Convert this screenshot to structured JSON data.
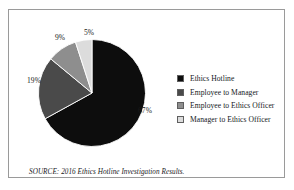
{
  "figure": {
    "background_color": "#ffffff",
    "frame_color": "#9a9a9a"
  },
  "chart_data": {
    "type": "pie",
    "title": "",
    "categories": [
      "Ethics Hotline",
      "Employee to Manager",
      "Employee to Ethics Officer",
      "Manager to Ethics Officer"
    ],
    "values": [
      67,
      19,
      9,
      5
    ],
    "value_labels": [
      "67%",
      "19%",
      "9%",
      "5%"
    ],
    "unit": "percent",
    "colors": [
      "#0d0d0d",
      "#4a4a4a",
      "#8e8e8e",
      "#dcdcdc"
    ],
    "start_angle_deg": 0,
    "direction": "clockwise",
    "labels_position": "outside",
    "legend_position": "right",
    "grid": false
  },
  "legend": {
    "entries": [
      {
        "label": "Ethics Hotline",
        "color": "#0d0d0d"
      },
      {
        "label": "Employee to Manager",
        "color": "#4a4a4a"
      },
      {
        "label": "Employee to Ethics Officer",
        "color": "#8e8e8e"
      },
      {
        "label": "Manager to Ethics Officer",
        "color": "#dcdcdc"
      }
    ]
  },
  "caption": {
    "source_text": "SOURCE: 2016 Ethics Hotline Investigation Results."
  }
}
